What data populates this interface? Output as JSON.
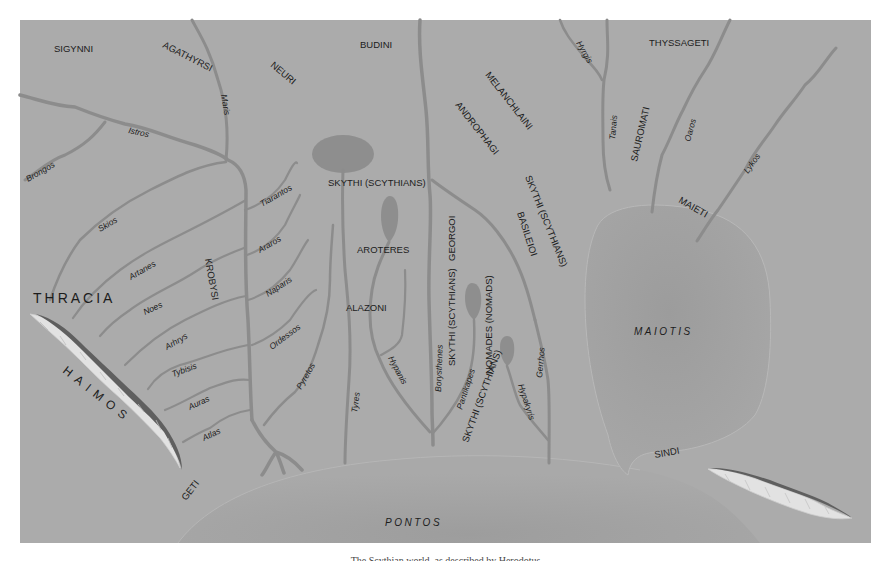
{
  "map": {
    "colors": {
      "land": "#ababab",
      "water_river": "#8c8c8c",
      "lake": "#8e8e8e",
      "sea": "#a3a3a3",
      "mountain_light": "#e6e6e6",
      "mountain_dark": "#5e5e5e",
      "text": "#1c1c1c",
      "page_background": "#ffffff"
    },
    "regions": {
      "thracia": "THRACIA",
      "haimos": "HAIMOS"
    },
    "seas": {
      "pontos": "PONTOS",
      "maiotis": "MAIOTIS"
    },
    "peoples": {
      "sigynni": "SIGYNNI",
      "agathyrsi": "AGATHYRSI",
      "neuri": "NEURI",
      "budini": "BUDINI",
      "thyssageti": "THYSSAGETI",
      "melanchlaini": "MELANCHLAINI",
      "androphagi": "ANDROPHAGI",
      "sauromati": "SAUROMATI",
      "maieti": "MAIETI",
      "skythi_top": "SKYTHI (SCYTHIANS)",
      "skythi_basileioi": "SKYTHI (SCYTHIANS)",
      "basileioi": "BASILEIOI",
      "aroteres": "AROTERES",
      "alazoni": "ALAZONI",
      "georgoi": "GEORGOI",
      "skythi_georgoi": "SKYTHI (SCYTHIANS)",
      "nomades": "NOMADES (NOMADS)",
      "skythi_nomades": "SKYTHI (SCYTHIANS)",
      "krobysi": "KROBYSI",
      "geti": "GETI",
      "sindi": "SINDI"
    },
    "rivers": {
      "istros": "Istros",
      "brongos": "Brongos",
      "maris": "Maris",
      "skios": "Skios",
      "artanes": "Artanes",
      "noes": "Noes",
      "arhrys": "Arhrys",
      "tybisis": "Tybisis",
      "auras": "Auras",
      "atlas": "Atlas",
      "tiarantos": "Tiarantos",
      "araros": "Araros",
      "naparis": "Naparis",
      "ordessos": "Ordessos",
      "pyretos": "Pyretos",
      "tyres": "Tyres",
      "hypanis": "Hypanis",
      "borysthenes": "Borysthenes",
      "pantikapes": "Pantikapes",
      "hypakyris": "Hypakyris",
      "gerrhos": "Gerrhos",
      "hyrgis": "Hyrgis",
      "tanais": "Tanais",
      "oaros": "Oaros",
      "lykos": "Lykos"
    }
  },
  "caption": "The Scythian world, as described by Herodotus"
}
